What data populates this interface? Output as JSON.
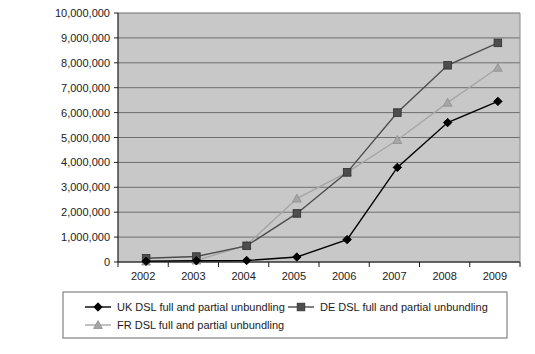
{
  "chart_data": {
    "type": "line",
    "title": "",
    "xlabel": "",
    "ylabel": "",
    "categories": [
      "2002",
      "2003",
      "2004",
      "2005",
      "2006",
      "2007",
      "2008",
      "2009"
    ],
    "ylim": [
      0,
      10000000
    ],
    "ytick_labels": [
      "10,000,000",
      "9,000,000",
      "8,000,000",
      "7,000,000",
      "6,000,000",
      "5,000,000",
      "4,000,000",
      "3,000,000",
      "2,000,000",
      "1,000,000",
      "0"
    ],
    "ytick_values": [
      10000000,
      9000000,
      8000000,
      7000000,
      6000000,
      5000000,
      4000000,
      3000000,
      2000000,
      1000000,
      0
    ],
    "grid": true,
    "legend_position": "bottom",
    "plot_background": "#c8c8c8",
    "series": [
      {
        "name": "UK DSL full and partial unbundling",
        "marker": "diamond",
        "color": "#000000",
        "values": [
          30000,
          50000,
          60000,
          200000,
          900000,
          3800000,
          5600000,
          6450000
        ]
      },
      {
        "name": "DE DSL full and partial unbundling",
        "marker": "square",
        "color": "#4d4d4d",
        "values": [
          150000,
          220000,
          650000,
          1950000,
          3600000,
          6000000,
          7900000,
          8800000
        ]
      },
      {
        "name": "FR DSL full and partial unbundling",
        "marker": "triangle",
        "color": "#a6a6a6",
        "values": [
          20000,
          60000,
          680000,
          2550000,
          3600000,
          4900000,
          6400000,
          7800000
        ]
      }
    ]
  }
}
